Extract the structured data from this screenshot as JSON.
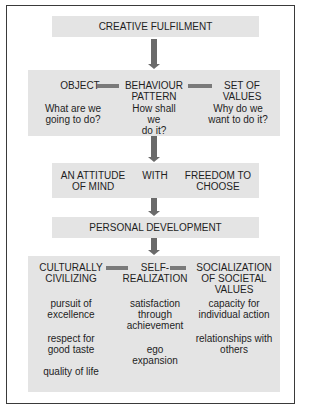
{
  "colors": {
    "box_fill": "#e4e4e4",
    "arrow": "#6a6a6a",
    "frame": "#3a3a3a"
  },
  "top": {
    "title": "CREATIVE FULFILMENT"
  },
  "row1": {
    "col1": {
      "heading": "OBJECT",
      "question_l1": "What are we",
      "question_l2": "going to do?"
    },
    "col2": {
      "heading_l1": "BEHAVIOUR",
      "heading_l2": "PATTERN",
      "question_l1": "How shall",
      "question_l2": "we",
      "question_l3": "do it?"
    },
    "col3": {
      "heading_l1": "SET OF",
      "heading_l2": "VALUES",
      "question_l1": "Why do we",
      "question_l2": "want to do it?"
    }
  },
  "row2": {
    "left_l1": "AN ATTITUDE",
    "left_l2": "OF MIND",
    "middle": "WITH",
    "right_l1": "FREEDOM TO",
    "right_l2": "CHOOSE"
  },
  "row3": {
    "title": "PERSONAL DEVELOPMENT"
  },
  "row4": {
    "col1": {
      "heading_l1": "CULTURALLY",
      "heading_l2": "CIVILIZING",
      "items": [
        {
          "l1": "pursuit of",
          "l2": "excellence"
        },
        {
          "l1": "respect for",
          "l2": "good taste"
        },
        {
          "l1": "quality of life"
        }
      ]
    },
    "col2": {
      "heading_l1": "SELF-",
      "heading_l2": "REALIZATION",
      "items": [
        {
          "l1": "satisfaction",
          "l2": "through",
          "l3": "achievement"
        },
        {
          "l1": "ego",
          "l2": "expansion"
        }
      ]
    },
    "col3": {
      "heading_l1": "SOCIALIZATION",
      "heading_l2": "OF SOCIETAL",
      "heading_l3": "VALUES",
      "items": [
        {
          "l1": "capacity for",
          "l2": "individual action"
        },
        {
          "l1": "relationships with",
          "l2": "others"
        }
      ]
    }
  }
}
